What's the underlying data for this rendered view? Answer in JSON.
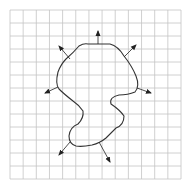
{
  "diagram": {
    "width": 194,
    "height": 186,
    "background": "#ffffff",
    "grid": {
      "x0": 10,
      "y0": 10,
      "x1": 181,
      "y1": 179,
      "cols": 13,
      "rows": 13,
      "color": "#c4c4c4"
    },
    "curve": {
      "color": "#333333",
      "stroke_width": 1.1,
      "path": "M88,44 L110,44 Q118,46 124,56 Q132,66 136,76 Q140,86 135,92 Q128,95 119,95 Q109,97 111,104 Q120,110 124,116 Q124,125 116,128 Q110,134 106,138 Q100,143 92,145 Q82,147 76,146 Q69,144 69,136 Q70,127 78,124 Q84,118 83,111 Q79,105 73,101 Q64,94 59,89 Q55,84 58,72 Q61,64 66,59 Q74,52 79,46 Q84,43 88,44 Z"
    },
    "arrows": [
      {
        "name": "normal-arrow-top",
        "x1": 98,
        "y1": 44,
        "x2": 98,
        "y2": 31
      },
      {
        "name": "normal-arrow-upper-left",
        "x1": 70,
        "y1": 59,
        "x2": 59,
        "y2": 46
      },
      {
        "name": "normal-arrow-upper-right",
        "x1": 124,
        "y1": 57,
        "x2": 136,
        "y2": 45
      },
      {
        "name": "normal-arrow-left",
        "x1": 58,
        "y1": 87,
        "x2": 45,
        "y2": 93
      },
      {
        "name": "normal-arrow-right",
        "x1": 137,
        "y1": 88,
        "x2": 151,
        "y2": 93
      },
      {
        "name": "normal-arrow-lower-left",
        "x1": 70,
        "y1": 142,
        "x2": 59,
        "y2": 155
      },
      {
        "name": "normal-arrow-bottom-right",
        "x1": 99,
        "y1": 142,
        "x2": 110,
        "y2": 162
      }
    ],
    "arrow_color": "#222222"
  }
}
